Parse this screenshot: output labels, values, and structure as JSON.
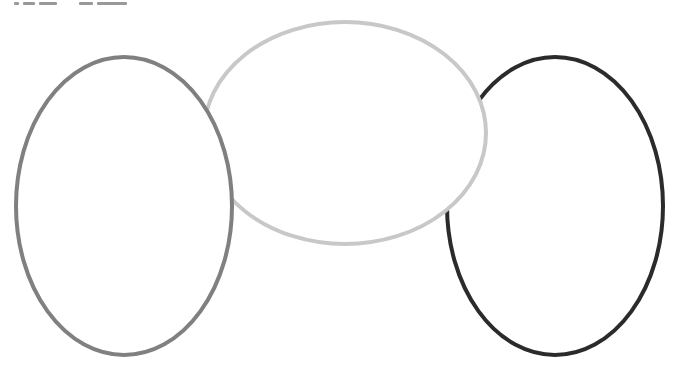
{
  "diagram": {
    "type": "overlapping-ellipses",
    "background": "#ffffff",
    "header_text_clipped": true,
    "ellipses": [
      {
        "id": "right",
        "label": "",
        "cx": 555,
        "cy": 206,
        "rx": 108,
        "ry": 149,
        "stroke": "#2b2b2b",
        "stroke_width": 4
      },
      {
        "id": "middle",
        "label": "",
        "cx": 345,
        "cy": 133,
        "rx": 141,
        "ry": 111,
        "stroke": "#c8c8c8",
        "stroke_width": 4
      },
      {
        "id": "left",
        "label": "",
        "cx": 124,
        "cy": 206,
        "rx": 108,
        "ry": 149,
        "stroke": "#808080",
        "stroke_width": 4
      }
    ]
  }
}
